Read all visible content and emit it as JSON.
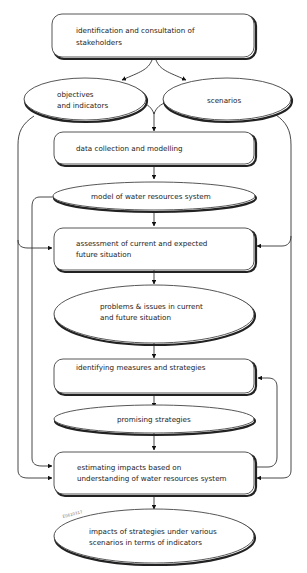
{
  "diagram": {
    "nodes": {
      "stakeholders": {
        "type": "box",
        "lines": [
          "identification and consultation of",
          "stakeholders"
        ]
      },
      "objectives": {
        "type": "ellipse",
        "lines": [
          "objectives",
          "and indicators"
        ]
      },
      "scenarios": {
        "type": "ellipse",
        "lines": [
          "scenarios"
        ]
      },
      "data_collection": {
        "type": "box",
        "lines": [
          "data collection and modelling"
        ]
      },
      "model": {
        "type": "ellipse",
        "lines": [
          "model of water resources system"
        ]
      },
      "assessment": {
        "type": "box",
        "lines": [
          "assessment of current and expected",
          "future situation"
        ]
      },
      "problems": {
        "type": "ellipse",
        "lines": [
          "problems & issues in current",
          "and future situation"
        ]
      },
      "identifying": {
        "type": "box",
        "lines": [
          "identifying measures and strategies"
        ]
      },
      "promising": {
        "type": "ellipse",
        "lines": [
          "promising strategies"
        ]
      },
      "estimating": {
        "type": "box",
        "lines": [
          "estimating impacts based on",
          "understanding of water resources system"
        ]
      },
      "impacts": {
        "type": "ellipse",
        "lines": [
          "impacts of strategies under various",
          "scenarios in terms of indicators"
        ]
      }
    },
    "figure_code": "E0610317",
    "edges": [
      [
        "stakeholders",
        "objectives"
      ],
      [
        "stakeholders",
        "scenarios"
      ],
      [
        "objectives",
        "data_collection"
      ],
      [
        "scenarios",
        "data_collection"
      ],
      [
        "data_collection",
        "model"
      ],
      [
        "model",
        "assessment"
      ],
      [
        "objectives",
        "assessment"
      ],
      [
        "scenarios",
        "assessment"
      ],
      [
        "assessment",
        "problems"
      ],
      [
        "problems",
        "identifying"
      ],
      [
        "identifying",
        "promising"
      ],
      [
        "promising",
        "estimating"
      ],
      [
        "model",
        "estimating"
      ],
      [
        "objectives",
        "estimating"
      ],
      [
        "scenarios",
        "estimating"
      ],
      [
        "estimating",
        "identifying"
      ],
      [
        "estimating",
        "impacts"
      ]
    ]
  }
}
